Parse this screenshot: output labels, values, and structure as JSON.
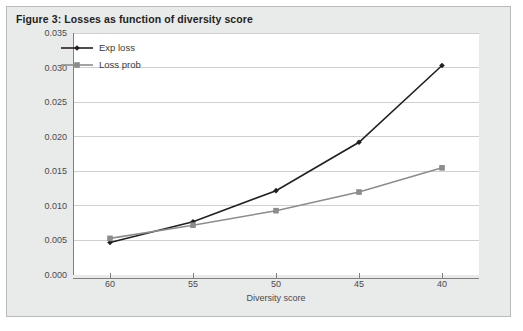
{
  "figure": {
    "title": "Figure 3: Losses as function of diversity score",
    "background_color": "#e9eaea",
    "border_color": "#b9bbbb",
    "plot_background_color": "#ffffff"
  },
  "chart_data": {
    "type": "line",
    "title": "Figure 3: Losses as function of diversity score",
    "xlabel": "Diversity score",
    "ylabel": "",
    "categories": [
      "60",
      "55",
      "50",
      "45",
      "40"
    ],
    "x": [
      60,
      55,
      50,
      45,
      40
    ],
    "xlim": [
      60,
      40
    ],
    "ylim": [
      0.0,
      0.035
    ],
    "yticks": [
      "0.000",
      "0.005",
      "0.010",
      "0.015",
      "0.020",
      "0.025",
      "0.030",
      "0.035"
    ],
    "ytick_values": [
      0.0,
      0.005,
      0.01,
      0.015,
      0.02,
      0.025,
      0.03,
      0.035
    ],
    "grid": "horizontal",
    "legend_position": "upper-left",
    "series": [
      {
        "name": "Exp loss",
        "values": [
          0.0047,
          0.0077,
          0.0122,
          0.0192,
          0.0303
        ],
        "color": "#231f20",
        "marker": "diamond"
      },
      {
        "name": "Loss prob",
        "values": [
          0.0053,
          0.0072,
          0.0093,
          0.012,
          0.0155
        ],
        "color": "#8c8c8c",
        "marker": "square"
      }
    ]
  }
}
